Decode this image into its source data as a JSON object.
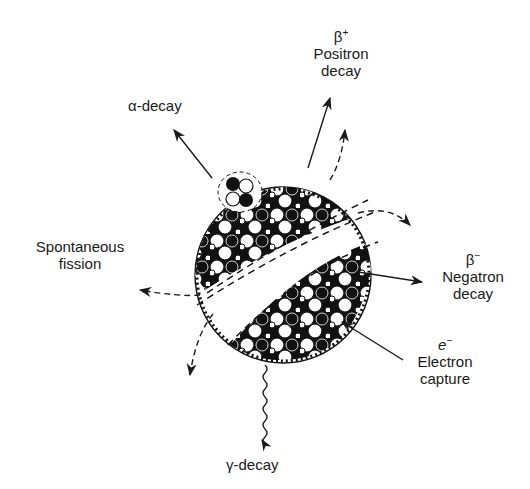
{
  "diagram": {
    "center": {
      "label": "nucleus"
    },
    "labels": {
      "alpha": {
        "text": "α-decay"
      },
      "positron": {
        "symbol": "β",
        "symbol_sup": "+",
        "line1": "Positron",
        "line2": "decay"
      },
      "negatron": {
        "symbol": "β",
        "symbol_sup": "−",
        "line1": "Negatron",
        "line2": "decay"
      },
      "electron_capture": {
        "symbol": "e",
        "symbol_sup": "−",
        "line1": "Electron",
        "line2": "capture"
      },
      "fission": {
        "line1": "Spontaneous",
        "line2": "fission"
      },
      "gamma": {
        "text": "γ-decay"
      }
    },
    "edges": [
      {
        "from": "nucleus",
        "to": "α-decay",
        "style": "solid arrow",
        "direction": "outward"
      },
      {
        "from": "nucleus",
        "to": "β+ Positron decay",
        "style": "solid arrow",
        "direction": "outward"
      },
      {
        "from": "nucleus",
        "to": "β− Negatron decay",
        "style": "solid arrow",
        "direction": "outward"
      },
      {
        "from": "e− Electron capture",
        "to": "nucleus",
        "style": "solid arrow",
        "direction": "inward"
      },
      {
        "from": "nucleus",
        "to": "γ-decay",
        "style": "wavy arrow",
        "direction": "outward"
      },
      {
        "from": "nucleus",
        "to": "Spontaneous fission",
        "style": "dashed arrows (fragments)",
        "direction": "outward"
      }
    ]
  }
}
